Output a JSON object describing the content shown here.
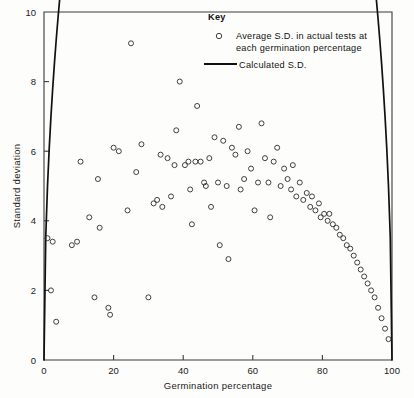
{
  "chart_data": {
    "type": "scatter",
    "title": "",
    "xlabel": "Germination percentage",
    "ylabel": "Standard deviation",
    "xlim": [
      0,
      100
    ],
    "ylim": [
      0,
      10
    ],
    "xticks": [
      0,
      20,
      40,
      60,
      80,
      100
    ],
    "yticks": [
      0,
      2,
      4,
      6,
      8,
      10
    ],
    "grid": false,
    "legend_position": "top-center",
    "legend": {
      "title": "Key",
      "entries": [
        {
          "marker": "open-circle",
          "label_line1": "Average  S.D. in actual tests at",
          "label_line2": "each germination percentage"
        },
        {
          "marker": "line",
          "label_line1": "Calculated  S.D.",
          "label_line2": ""
        }
      ]
    },
    "series": [
      {
        "name": "Average S.D. in actual tests at each germination percentage",
        "marker": "open-circle",
        "points": [
          [
            1.0,
            3.5
          ],
          [
            2.0,
            2.0
          ],
          [
            2.5,
            3.4
          ],
          [
            3.5,
            1.1
          ],
          [
            8.0,
            3.3
          ],
          [
            9.5,
            3.4
          ],
          [
            10.5,
            5.7
          ],
          [
            13.0,
            4.1
          ],
          [
            14.5,
            1.8
          ],
          [
            15.5,
            5.2
          ],
          [
            16.0,
            3.8
          ],
          [
            18.5,
            1.5
          ],
          [
            19.0,
            1.3
          ],
          [
            20.0,
            6.1
          ],
          [
            21.5,
            6.0
          ],
          [
            24.0,
            4.3
          ],
          [
            25.0,
            9.1
          ],
          [
            26.5,
            5.4
          ],
          [
            28.0,
            6.2
          ],
          [
            30.0,
            1.8
          ],
          [
            31.5,
            4.5
          ],
          [
            32.5,
            4.6
          ],
          [
            33.5,
            5.9
          ],
          [
            34.0,
            4.4
          ],
          [
            35.5,
            5.8
          ],
          [
            36.5,
            4.7
          ],
          [
            37.5,
            5.6
          ],
          [
            38.0,
            6.6
          ],
          [
            39.0,
            8.0
          ],
          [
            40.5,
            5.6
          ],
          [
            41.5,
            5.7
          ],
          [
            42.0,
            4.9
          ],
          [
            42.5,
            3.9
          ],
          [
            43.5,
            5.7
          ],
          [
            44.0,
            7.3
          ],
          [
            45.0,
            5.7
          ],
          [
            46.0,
            5.1
          ],
          [
            46.5,
            5.0
          ],
          [
            47.5,
            5.8
          ],
          [
            48.0,
            4.4
          ],
          [
            49.0,
            6.4
          ],
          [
            50.0,
            5.1
          ],
          [
            50.5,
            3.3
          ],
          [
            51.5,
            6.3
          ],
          [
            52.5,
            5.0
          ],
          [
            53.0,
            2.9
          ],
          [
            54.0,
            6.1
          ],
          [
            55.0,
            5.9
          ],
          [
            56.0,
            6.7
          ],
          [
            56.5,
            4.9
          ],
          [
            57.5,
            5.2
          ],
          [
            58.5,
            6.0
          ],
          [
            59.5,
            5.5
          ],
          [
            60.5,
            4.3
          ],
          [
            61.5,
            5.1
          ],
          [
            62.5,
            6.8
          ],
          [
            63.5,
            5.8
          ],
          [
            64.5,
            5.1
          ],
          [
            65.0,
            4.1
          ],
          [
            66.0,
            5.7
          ],
          [
            67.0,
            6.1
          ],
          [
            68.0,
            5.0
          ],
          [
            69.0,
            5.5
          ],
          [
            70.0,
            5.2
          ],
          [
            71.0,
            4.9
          ],
          [
            71.5,
            5.6
          ],
          [
            72.5,
            4.7
          ],
          [
            73.5,
            5.1
          ],
          [
            74.5,
            4.6
          ],
          [
            75.5,
            4.8
          ],
          [
            76.5,
            4.4
          ],
          [
            77.0,
            4.7
          ],
          [
            78.0,
            4.3
          ],
          [
            79.0,
            4.5
          ],
          [
            79.5,
            4.1
          ],
          [
            80.5,
            4.2
          ],
          [
            81.5,
            4.0
          ],
          [
            82.0,
            4.2
          ],
          [
            83.0,
            3.9
          ],
          [
            84.0,
            3.8
          ],
          [
            85.0,
            3.6
          ],
          [
            86.0,
            3.5
          ],
          [
            87.0,
            3.3
          ],
          [
            88.0,
            3.2
          ],
          [
            89.0,
            3.0
          ],
          [
            90.0,
            2.8
          ],
          [
            91.0,
            2.6
          ],
          [
            92.0,
            2.4
          ],
          [
            93.0,
            2.2
          ],
          [
            94.0,
            2.0
          ],
          [
            95.0,
            1.8
          ],
          [
            96.0,
            1.5
          ],
          [
            97.0,
            1.2
          ],
          [
            98.0,
            0.9
          ],
          [
            99.0,
            0.6
          ]
        ]
      }
    ],
    "fit_curve": {
      "name": "Calculated S.D.",
      "formula": "sd = 0.5 * sqrt(p * (100 - p))",
      "peak": {
        "x": 50,
        "y": 5.0
      },
      "endpoints": [
        {
          "x": 0,
          "y": 0
        },
        {
          "x": 100,
          "y": 0
        }
      ]
    }
  }
}
